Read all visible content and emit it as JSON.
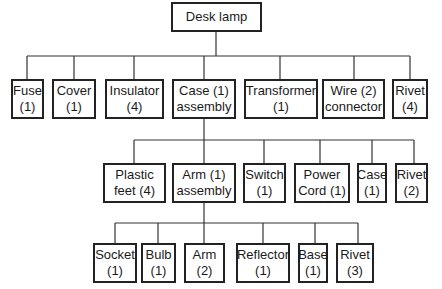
{
  "root": {
    "line1": "Desk lamp"
  },
  "level1": [
    {
      "line1": "Fuse",
      "line2": "(1)"
    },
    {
      "line1": "Cover",
      "line2": "(1)"
    },
    {
      "line1": "Insulator",
      "line2": "(4)"
    },
    {
      "line1": "Case (1)",
      "line2": "assembly"
    },
    {
      "line1": "Transformer",
      "line2": "(1)"
    },
    {
      "line1": "Wire (2)",
      "line2": "connector"
    },
    {
      "line1": "Rivet",
      "line2": "(4)"
    }
  ],
  "level2": [
    {
      "line1": "Plastic",
      "line2": "feet (4)"
    },
    {
      "line1": "Arm (1)",
      "line2": "assembly"
    },
    {
      "line1": "Switch",
      "line2": "(1)"
    },
    {
      "line1": "Power",
      "line2": "Cord (1)"
    },
    {
      "line1": "Case",
      "line2": "(1)"
    },
    {
      "line1": "Rivet",
      "line2": "(2)"
    }
  ],
  "level3": [
    {
      "line1": "Socket",
      "line2": "(1)"
    },
    {
      "line1": "Bulb",
      "line2": "(1)"
    },
    {
      "line1": "Arm",
      "line2": "(2)"
    },
    {
      "line1": "Reflector",
      "line2": "(1)"
    },
    {
      "line1": "Base",
      "line2": "(1)"
    },
    {
      "line1": "Rivet",
      "line2": "(3)"
    }
  ]
}
